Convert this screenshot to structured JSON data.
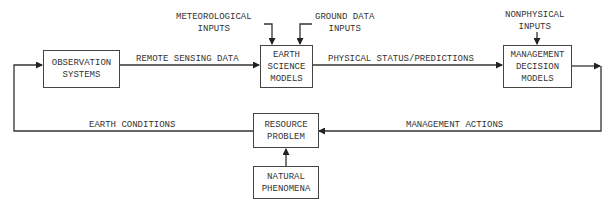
{
  "diagram": {
    "type": "flow-diagram",
    "nodes": {
      "observation": {
        "label": "OBSERVATION\nSYSTEMS"
      },
      "earth_science": {
        "label": "EARTH\nSCIENCE\nMODELS"
      },
      "management_decision": {
        "label": "MANAGEMENT\nDECISION\nMODELS"
      },
      "resource_problem": {
        "label": "RESOURCE\nPROBLEM"
      },
      "natural_phenomena": {
        "label": "NATURAL\nPHENOMENA"
      }
    },
    "inputs": {
      "meteorological": "METEOROLOGICAL\nINPUTS",
      "ground_data": "GROUND DATA\nINPUTS",
      "nonphysical": "NONPHYSICAL\nINPUTS"
    },
    "edges": {
      "remote_sensing": "REMOTE SENSING DATA",
      "physical_status": "PHYSICAL STATUS/PREDICTIONS",
      "earth_conditions": "EARTH CONDITIONS",
      "management_actions": "MANAGEMENT ACTIONS"
    },
    "colors": {
      "line": "#333333",
      "background": "#ffffff"
    }
  }
}
